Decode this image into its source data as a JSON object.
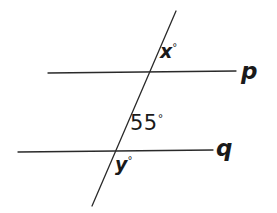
{
  "figure": {
    "background_color": "#ffffff",
    "stroke_color": "#2a2a2a",
    "text_color": "#1a1a1a",
    "stroke_width": 1.3,
    "width": 277,
    "height": 213
  },
  "lines": {
    "p": {
      "name": "p",
      "label": "p",
      "x1": 48,
      "y1": 73,
      "x2": 236,
      "y2": 71
    },
    "q": {
      "name": "q",
      "label": "q",
      "x1": 18,
      "y1": 152,
      "x2": 213,
      "y2": 150
    },
    "transversal": {
      "name": "transversal",
      "label": "",
      "x1": 176,
      "y1": 11,
      "x2": 92,
      "y2": 206
    }
  },
  "intersections": {
    "with_p": {
      "x": 150,
      "y": 72
    },
    "with_q": {
      "x": 111,
      "y": 151
    }
  },
  "angle_labels": [
    {
      "id": "x",
      "value": "x",
      "degree_symbol": "°",
      "position": "above-right-of-p-intersection"
    },
    {
      "id": "55",
      "value": "55",
      "degree_symbol": "°",
      "position": "above-right-of-q-intersection"
    },
    {
      "id": "y",
      "value": "y",
      "degree_symbol": "°",
      "position": "below-right-of-q-intersection"
    }
  ]
}
